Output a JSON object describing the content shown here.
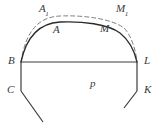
{
  "figure": {
    "background_color": "#ffffff",
    "width": 162,
    "height": 134,
    "stroke_colors": {
      "solid_curve": "#2b2b2b",
      "dashed_curve": "#7d7d88",
      "straight_line": "#3c3c3c",
      "label_text": "#3a3a3a"
    },
    "labels": [
      {
        "id": "A1",
        "base": "A",
        "sub": "1",
        "x": 39,
        "y": 3,
        "italic": true
      },
      {
        "id": "M1",
        "base": "M",
        "sub": "1",
        "x": 116,
        "y": 3,
        "italic": true
      },
      {
        "id": "A",
        "base": "A",
        "sub": "",
        "x": 53,
        "y": 24,
        "italic": true
      },
      {
        "id": "M",
        "base": "M",
        "sub": "",
        "x": 100,
        "y": 23,
        "italic": true
      },
      {
        "id": "B",
        "base": "B",
        "sub": "",
        "x": 8,
        "y": 55,
        "italic": true
      },
      {
        "id": "L",
        "base": "L",
        "sub": "",
        "x": 144,
        "y": 55,
        "italic": true
      },
      {
        "id": "p",
        "base": "p",
        "sub": "",
        "x": 90,
        "y": 78,
        "italic": true
      },
      {
        "id": "C",
        "base": "C",
        "sub": "",
        "x": 7,
        "y": 84,
        "italic": true
      },
      {
        "id": "K",
        "base": "K",
        "sub": "",
        "x": 144,
        "y": 84,
        "italic": true
      }
    ],
    "geometry": {
      "points": {
        "B": [
          21,
          62
        ],
        "L": [
          137,
          62
        ],
        "C": [
          21,
          91
        ],
        "K": [
          137,
          91
        ],
        "A": [
          55,
          22
        ],
        "M": [
          103,
          21
        ],
        "A1": [
          46,
          16
        ],
        "M1": [
          119,
          15
        ],
        "C_tail": [
          43,
          122
        ],
        "K_tail": [
          124,
          108
        ]
      },
      "paths": {
        "solid_arc": "M 21 62 C 27 34, 42 23, 60 22 C 82 21, 108 24, 120 33 C 130 41, 135 53, 137 62",
        "dashed_arc": "M 21 62 C 26 29, 40 17, 60 16 C 85 15, 112 19, 124 28 C 132 36, 136 52, 137 62",
        "base_line": "M 21 62 L 137 62",
        "left_side": "M 21 62 L 21 91",
        "right_side": "M 137 62 L 137 91",
        "left_tail": "M 21 91 L 43 122",
        "right_tail": "M 137 91 L 124 108"
      },
      "dash_pattern": "4 3"
    }
  }
}
